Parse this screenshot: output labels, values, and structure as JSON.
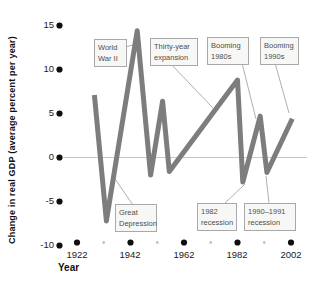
{
  "colors": {
    "curve": "#7d7d7d",
    "zero_line": "#c8c8c8",
    "leader_line": "#b0b0b0",
    "axis_dot": "#0f0f0f",
    "minor_dot": "#c2c2c2",
    "box_border": "#a9a9a9",
    "box_bg": "#f7f7f5",
    "box_text": "#4f4f4f",
    "tick_text": "#1c1c1c"
  },
  "chart_data": {
    "type": "line",
    "title": "",
    "xlabel": "Year",
    "ylabel": "Change in real GDP (average percent per year)",
    "x_ticks": [
      1922,
      1942,
      1962,
      1982,
      2002
    ],
    "x_tick_labels": [
      "1922",
      "1942",
      "1962",
      "1982",
      "2002"
    ],
    "x_minor_ticks": [
      1932,
      1952,
      1972,
      1992
    ],
    "y_ticks": [
      15,
      10,
      5,
      0,
      -5,
      -10
    ],
    "y_tick_labels": [
      "15",
      "10",
      "5",
      "0",
      "-5",
      "-10"
    ],
    "xlim": [
      1922,
      2003
    ],
    "ylim": [
      -10,
      15
    ],
    "grid": "zero-line-only",
    "legend": "none",
    "series": [
      {
        "name": "Change in real GDP",
        "points": [
          [
            1928.5,
            7.1
          ],
          [
            1933,
            -7.2
          ],
          [
            1944.5,
            14.4
          ],
          [
            1949.5,
            -2.0
          ],
          [
            1954,
            6.4
          ],
          [
            1956.5,
            -1.6
          ],
          [
            1982,
            8.8
          ],
          [
            1984,
            -2.8
          ],
          [
            1990.5,
            4.7
          ],
          [
            1993,
            -1.7
          ],
          [
            2002.5,
            4.4
          ]
        ]
      }
    ],
    "annotations": [
      {
        "id": "world-war-ii",
        "label": "World War II",
        "lines": [
          "World",
          "War II"
        ],
        "target_point": [
          1944.5,
          14.4
        ]
      },
      {
        "id": "thirty-year-expansion",
        "label": "Thirty-year expansion",
        "lines": [
          "Thirty-year",
          "expansion"
        ],
        "target_point": [
          1973,
          5.6
        ]
      },
      {
        "id": "booming-1980s",
        "label": "Booming 1980s",
        "lines": [
          "Booming",
          "1980s"
        ],
        "target_point": [
          1990.5,
          4.7
        ]
      },
      {
        "id": "booming-1990s",
        "label": "Booming 1990s",
        "lines": [
          "Booming",
          "1990s"
        ],
        "target_point": [
          2002.5,
          4.4
        ]
      },
      {
        "id": "great-depression",
        "label": "Great Depression",
        "lines": [
          "Great",
          "Depression"
        ],
        "target_point": [
          1933,
          -7.2
        ]
      },
      {
        "id": "recession-1982",
        "label": "1982 recession",
        "lines": [
          "1982",
          "recession"
        ],
        "target_point": [
          1984,
          -2.8
        ]
      },
      {
        "id": "recession-1990-1991",
        "label": "1990–1991 recession",
        "lines": [
          "1990–1991",
          "recession"
        ],
        "target_point": [
          1993,
          -1.7
        ]
      }
    ]
  }
}
